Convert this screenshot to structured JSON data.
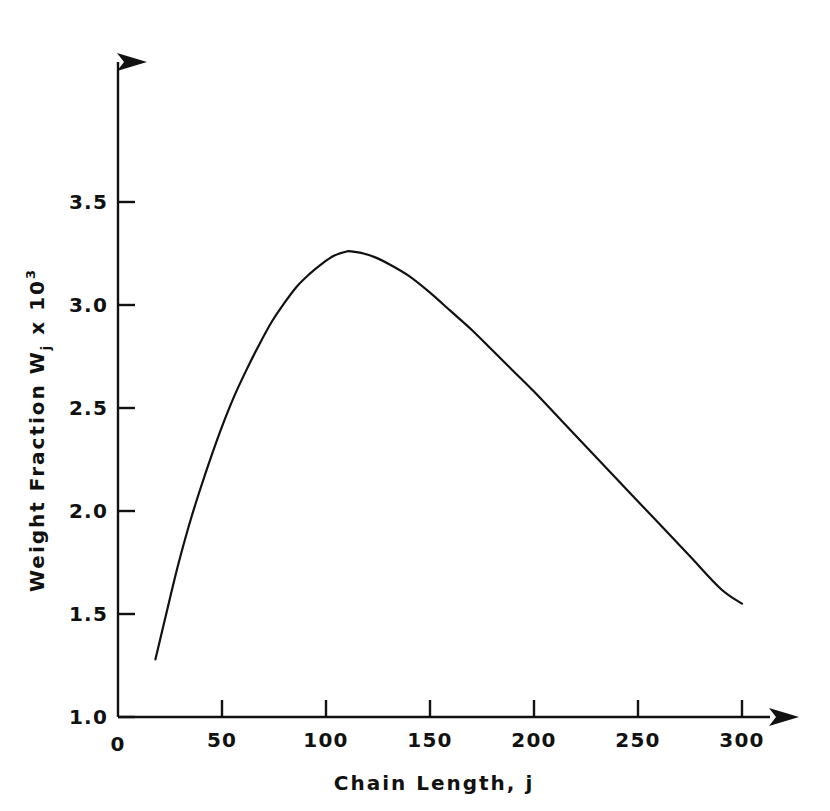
{
  "figure": {
    "background_color": "#ffffff",
    "ink_color": "#111111"
  },
  "axes": {
    "x": {
      "title": "Chain Length, j",
      "origin_label": "0",
      "tick_labels": [
        "0",
        "50",
        "100",
        "150",
        "200",
        "250",
        "300"
      ],
      "tick_values": [
        0,
        50,
        100,
        150,
        200,
        250,
        300
      ],
      "range": [
        0,
        300
      ],
      "arrowhead": "right"
    },
    "y": {
      "title_main": "Weight Fraction W",
      "title_subscript": "j",
      "title_mid": " x 10",
      "title_superscript": "3",
      "title_plain": "Weight Fraction Wj x 10^3",
      "tick_labels": [
        "1.0",
        "1.5",
        "2.0",
        "2.5",
        "3.0",
        "3.5"
      ],
      "tick_values": [
        1.0,
        1.5,
        2.0,
        2.5,
        3.0,
        3.5
      ],
      "range": [
        1.0,
        3.5
      ],
      "arrowhead": "up"
    }
  },
  "chart_data": {
    "type": "line",
    "title": "",
    "xlabel": "Chain Length, j",
    "ylabel": "Weight Fraction Wj x 10^3",
    "xlim": [
      0,
      300
    ],
    "ylim": [
      1.0,
      3.5
    ],
    "grid": false,
    "legend": false,
    "xticks": [
      0,
      50,
      100,
      150,
      200,
      250,
      300
    ],
    "yticks": [
      1.0,
      1.5,
      2.0,
      2.5,
      3.0,
      3.5
    ],
    "series": [
      {
        "name": "Weight fraction distribution",
        "color": "#111111",
        "line_width": 2.2,
        "peak": {
          "x": 112,
          "y": 3.26
        },
        "x": [
          18,
          22,
          26,
          30,
          35,
          40,
          45,
          50,
          56,
          62,
          68,
          74,
          80,
          86,
          92,
          98,
          104,
          110,
          112,
          118,
          124,
          130,
          140,
          150,
          160,
          170,
          180,
          190,
          200,
          215,
          230,
          245,
          260,
          275,
          290,
          300
        ],
        "y": [
          1.28,
          1.45,
          1.62,
          1.78,
          1.96,
          2.12,
          2.27,
          2.41,
          2.56,
          2.69,
          2.81,
          2.92,
          3.01,
          3.09,
          3.15,
          3.2,
          3.24,
          3.26,
          3.26,
          3.25,
          3.23,
          3.2,
          3.14,
          3.06,
          2.97,
          2.88,
          2.78,
          2.68,
          2.58,
          2.42,
          2.26,
          2.1,
          1.94,
          1.78,
          1.62,
          1.55
        ]
      }
    ]
  }
}
